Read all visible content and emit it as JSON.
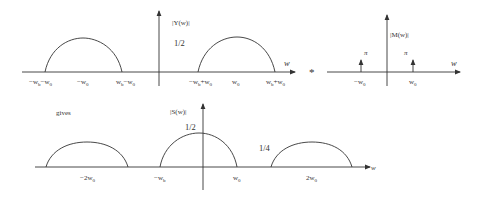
{
  "diagram": {
    "operator": "*",
    "connector_label": "gives",
    "top_left_plot": {
      "ylabel": "|Y(w)|",
      "xlabel": "w",
      "amplitude_label": "1/2",
      "tick_labels": [
        "−wb−w0",
        "−w0",
        "wb−w0",
        "−wb+w0",
        "w0",
        "wb+w0"
      ],
      "tick_parts": [
        {
          "a": "−w",
          "as": "b",
          "b": "−w",
          "bs": "0"
        },
        {
          "a": "−w",
          "as": "0"
        },
        {
          "a": "w",
          "as": "b",
          "b": "−w",
          "bs": "0"
        },
        {
          "a": "−w",
          "as": "b",
          "b": "+w",
          "bs": "0"
        },
        {
          "a": "w",
          "as": "0"
        },
        {
          "a": "w",
          "as": "b",
          "b": "+w",
          "bs": "0"
        }
      ],
      "lobes": [
        {
          "center": "−w0",
          "from": "−wb−w0",
          "to": "wb−w0",
          "height": "1/2"
        },
        {
          "center": "w0",
          "from": "−wb+w0",
          "to": "wb+w0",
          "height": "1/2"
        }
      ]
    },
    "top_right_plot": {
      "ylabel": "|M(w)|",
      "xlabel": "w",
      "impulse_label": "π",
      "tick_parts": [
        {
          "a": "−w",
          "as": "0"
        },
        {
          "a": "w",
          "as": "0"
        }
      ],
      "impulses": [
        {
          "at": "−w0",
          "weight": "π"
        },
        {
          "at": "w0",
          "weight": "π"
        }
      ]
    },
    "bottom_plot": {
      "ylabel": "|S(w)|",
      "xlabel": "w",
      "center_amplitude_label": "1/2",
      "side_amplitude_label": "1/4",
      "tick_parts": [
        {
          "a": "−2w",
          "as": "0"
        },
        {
          "a": "−w",
          "as": "b"
        },
        {
          "a": "w",
          "as": "0"
        },
        {
          "a": "2w",
          "as": "0"
        }
      ],
      "lobes": [
        {
          "center": "−2w0",
          "height": "1/4"
        },
        {
          "center": "0",
          "from": "−wb",
          "to": "wb",
          "height": "1/2"
        },
        {
          "center": "2w0",
          "height": "1/4"
        }
      ]
    }
  }
}
